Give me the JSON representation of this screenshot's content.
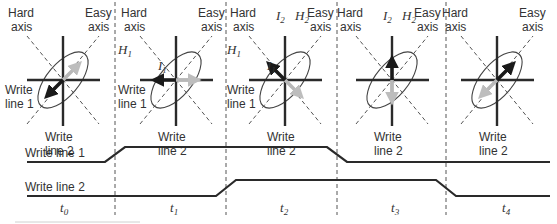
{
  "diagram": {
    "type": "toggle-MRAM write sequence (timing diagram)",
    "axis_labels": {
      "hard": [
        "Hard",
        "axis"
      ],
      "easy": [
        "Easy",
        "axis"
      ],
      "write_line_1": [
        "Write",
        "line 1"
      ],
      "write_line_2": [
        "Write",
        "line 2"
      ]
    },
    "field_labels": {
      "H1": {
        "base": "H",
        "sub": "1"
      },
      "H2": {
        "base": "H",
        "sub": "2"
      },
      "I1": {
        "base": "I",
        "sub": "1"
      },
      "I2": {
        "base": "I",
        "sub": "2"
      }
    },
    "panels": [
      {
        "time": {
          "base": "t",
          "sub": "0"
        },
        "show_wl1_label": true,
        "show_H1": false,
        "show_I1": false,
        "show_H2": false,
        "show_I2": false,
        "black_arrow": "down-left",
        "gray_arrow": "up-right"
      },
      {
        "time": {
          "base": "t",
          "sub": "1"
        },
        "show_wl1_label": true,
        "show_H1": true,
        "show_I1": true,
        "show_H2": false,
        "show_I2": false,
        "black_arrow": "left",
        "gray_arrow": "right"
      },
      {
        "time": {
          "base": "t",
          "sub": "2"
        },
        "show_wl1_label": true,
        "show_H1": true,
        "show_I1": true,
        "show_H2": true,
        "show_I2": true,
        "black_arrow": "up-left",
        "gray_arrow": "down-right"
      },
      {
        "time": {
          "base": "t",
          "sub": "3"
        },
        "show_wl1_label": false,
        "show_H1": false,
        "show_I1": false,
        "show_H2": true,
        "show_I2": true,
        "black_arrow": "up",
        "gray_arrow": "down"
      },
      {
        "time": {
          "base": "t",
          "sub": "4"
        },
        "show_wl1_label": false,
        "show_H1": false,
        "show_I1": false,
        "show_H2": false,
        "show_I2": false,
        "black_arrow": "up-right",
        "gray_arrow": "down-left"
      }
    ],
    "waveforms": [
      {
        "label": "Write line 1",
        "states": [
          "low",
          "high",
          "high",
          "low",
          "low"
        ]
      },
      {
        "label": "Write line 2",
        "states": [
          "low",
          "low",
          "high",
          "high",
          "low"
        ]
      }
    ],
    "colors": {
      "ink": "#2a2a2a",
      "ghost_arrow": "#b8b8b8",
      "dashed": "#555555",
      "ellipse": "#444444"
    }
  }
}
